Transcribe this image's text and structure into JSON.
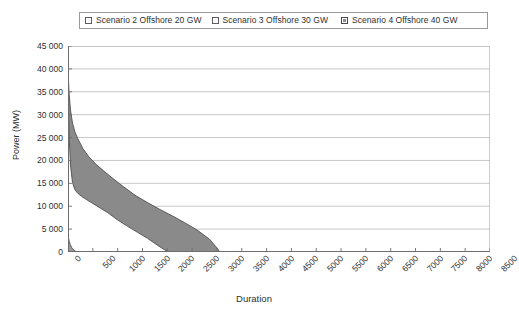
{
  "chart_data": {
    "type": "area",
    "title": "",
    "xlabel": "Duration",
    "ylabel": "Power (MW)",
    "xlim": [
      0,
      8500
    ],
    "ylim": [
      0,
      45000
    ],
    "grid": true,
    "legend_position": "top",
    "xticks": [
      0,
      500,
      1000,
      1500,
      2000,
      2500,
      3000,
      3500,
      4000,
      4500,
      5000,
      5500,
      6000,
      6500,
      7000,
      7500,
      8000,
      8500
    ],
    "yticks": [
      0,
      5000,
      10000,
      15000,
      20000,
      25000,
      30000,
      35000,
      40000,
      45000
    ],
    "ytick_labels": [
      "0",
      "5 000",
      "10 000",
      "15 000",
      "20 000",
      "25 000",
      "30 000",
      "35 000",
      "40 000",
      "45 000"
    ],
    "xtick_labels": [
      "0",
      "500",
      "1000",
      "1500",
      "2000",
      "2500",
      "3000",
      "3500",
      "4000",
      "4500",
      "5000",
      "5500",
      "6000",
      "6500",
      "7000",
      "7500",
      "8000",
      "8500"
    ],
    "series": [
      {
        "name": "Scenario 2 Offshore 20 GW",
        "swatch": "white",
        "fill": "#9a9a9a",
        "x": [
          0,
          10,
          25,
          45,
          70,
          100,
          140,
          180,
          210
        ],
        "values": [
          4200,
          3100,
          2300,
          1650,
          1050,
          560,
          220,
          60,
          0
        ]
      },
      {
        "name": "Scenario 3 Offshore 30 GW",
        "swatch": "white",
        "fill": "#ffffff",
        "x": [
          0,
          20,
          50,
          90,
          140,
          200,
          280,
          380,
          500,
          650,
          800,
          1000,
          1200,
          1400,
          1600,
          1800,
          1950,
          2050
        ],
        "values": [
          37000,
          26000,
          19000,
          15200,
          13600,
          12800,
          12100,
          11400,
          10600,
          9600,
          8600,
          7000,
          5600,
          4300,
          3000,
          1500,
          450,
          0
        ]
      },
      {
        "name": "Scenario 4 Offshore 40 GW",
        "swatch": "gray-pattern",
        "fill": "#8a8a8a",
        "x": [
          0,
          20,
          50,
          90,
          140,
          200,
          300,
          420,
          560,
          720,
          900,
          1100,
          1350,
          1600,
          1850,
          2100,
          2350,
          2600,
          2850,
          3000,
          3060
        ],
        "values": [
          40000,
          35000,
          31000,
          28200,
          26200,
          24700,
          22600,
          20800,
          19200,
          17700,
          16100,
          14400,
          12400,
          10800,
          9300,
          7900,
          6400,
          4800,
          2800,
          900,
          0
        ]
      }
    ]
  },
  "legend": {
    "entries": [
      {
        "label": "Scenario 2 Offshore 20 GW"
      },
      {
        "label": "Scenario 3 Offshore 30 GW"
      },
      {
        "label": "Scenario 4 Offshore 40 GW"
      }
    ]
  }
}
